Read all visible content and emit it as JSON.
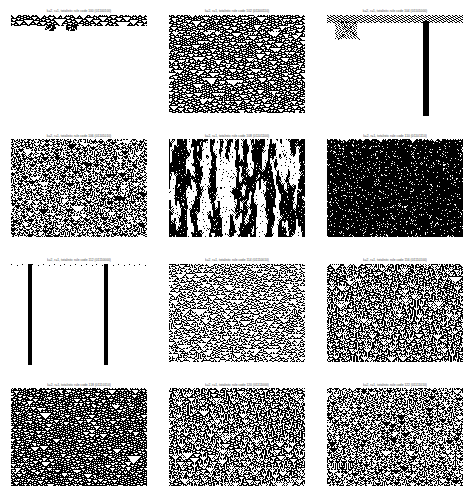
{
  "figure": {
    "rows": 4,
    "cols": 3,
    "background_color": "#ffffff",
    "cell_on_color": "#000000",
    "cell_off_color": "#ffffff",
    "bottom_caption": ""
  },
  "chart_data": {
    "type": "heatmap",
    "subtitle": "Space-time evolution diagrams from random initial conditions",
    "xlabel": "cell position (space)",
    "ylabel": "time step (downward)",
    "grid": false,
    "legend": "none",
    "layout": {
      "rows": 4,
      "cols": 3,
      "panel_width_px": 136,
      "panel_height_px": 101
    },
    "panels": [
      {
        "index": 0,
        "row": 0,
        "col": 0,
        "caption": "k=2, r=1, totalistic rule code 100 (01100100)",
        "rule_code": 100,
        "rule_binary": "01100100",
        "k": 2,
        "r": 1,
        "class": "class-1-dies-out",
        "active_rows": 12,
        "density": 0.06,
        "seed": 1009
      },
      {
        "index": 1,
        "row": 0,
        "col": 1,
        "caption": "k=2, r=1, totalistic rule code 102 (01100110)",
        "rule_code": 102,
        "rule_binary": "01100110",
        "k": 2,
        "r": 1,
        "class": "class-3-chaotic",
        "active_rows": 101,
        "density": 0.5,
        "seed": 2021
      },
      {
        "index": 2,
        "row": 0,
        "col": 2,
        "caption": "k=2, r=1, totalistic rule code 104 (01101000)",
        "rule_code": 104,
        "rule_binary": "01101000",
        "k": 2,
        "r": 1,
        "class": "class-4-localized",
        "active_rows": 101,
        "density": 0.05,
        "seed": 3037
      },
      {
        "index": 3,
        "row": 1,
        "col": 0,
        "caption": "k=2, r=1, totalistic rule code 106 (01101010)",
        "rule_code": 106,
        "rule_binary": "01101010",
        "k": 2,
        "r": 1,
        "class": "class-3-chaotic",
        "active_rows": 101,
        "density": 0.48,
        "seed": 4051
      },
      {
        "index": 4,
        "row": 1,
        "col": 1,
        "caption": "k=2, r=1, totalistic rule code 108 (01101100)",
        "rule_code": 108,
        "rule_binary": "01101100",
        "k": 2,
        "r": 1,
        "class": "class-3-chaotic",
        "active_rows": 101,
        "density": 0.44,
        "seed": 5077
      },
      {
        "index": 5,
        "row": 1,
        "col": 2,
        "caption": "k=2, r=1, totalistic rule code 110 (01101110)",
        "rule_code": 110,
        "rule_binary": "01101110",
        "k": 2,
        "r": 1,
        "class": "class-3-chaotic",
        "active_rows": 101,
        "density": 0.46,
        "seed": 6089
      },
      {
        "index": 6,
        "row": 2,
        "col": 0,
        "caption": "k=2, r=1, totalistic rule code 112 (01110000)",
        "rule_code": 112,
        "rule_binary": "01110000",
        "k": 2,
        "r": 1,
        "class": "class-2-vertical-stripes",
        "active_rows": 101,
        "density": 0.04,
        "seed": 7103
      },
      {
        "index": 7,
        "row": 2,
        "col": 1,
        "caption": "k=2, r=1, totalistic rule code 114 (01110010)",
        "rule_code": 114,
        "rule_binary": "01110010",
        "k": 2,
        "r": 1,
        "class": "class-3-chaotic",
        "active_rows": 101,
        "density": 0.42,
        "seed": 8111
      },
      {
        "index": 8,
        "row": 2,
        "col": 2,
        "caption": "k=2, r=1, totalistic rule code 116 (01110100)",
        "rule_code": 116,
        "rule_binary": "01110100",
        "k": 2,
        "r": 1,
        "class": "class-4-nested-triangles",
        "active_rows": 101,
        "density": 0.38,
        "seed": 9127
      },
      {
        "index": 9,
        "row": 3,
        "col": 0,
        "caption": "k=2, r=1, totalistic rule code 118 (01110110)",
        "rule_code": 118,
        "rule_binary": "01110110",
        "k": 2,
        "r": 1,
        "class": "class-3-textured",
        "active_rows": 101,
        "density": 0.45,
        "seed": 10139
      },
      {
        "index": 10,
        "row": 3,
        "col": 1,
        "caption": "k=2, r=1, totalistic rule code 120 (01111000)",
        "rule_code": 120,
        "rule_binary": "01111000",
        "k": 2,
        "r": 1,
        "class": "class-4-nested-triangles",
        "active_rows": 101,
        "density": 0.34,
        "seed": 11149
      },
      {
        "index": 11,
        "row": 3,
        "col": 2,
        "caption": "k=2, r=1, totalistic rule code 122 (01111010)",
        "rule_code": 122,
        "rule_binary": "01111010",
        "k": 2,
        "r": 1,
        "class": "class-3-textured",
        "active_rows": 101,
        "density": 0.43,
        "seed": 12157
      }
    ]
  }
}
